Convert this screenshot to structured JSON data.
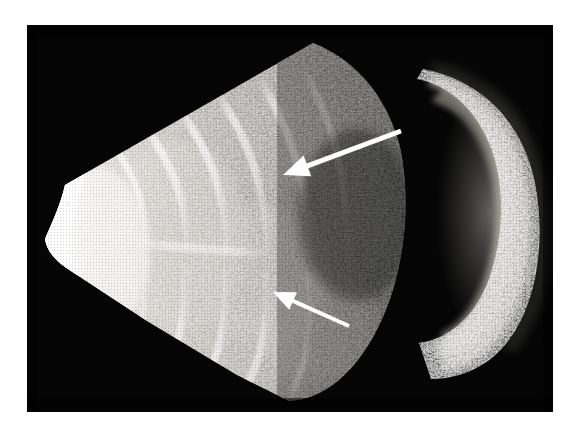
{
  "figure": {
    "kind": "medical-ultrasound-bscan",
    "modality": "B-mode ultrasonography",
    "caption": "",
    "page_background_color": "#ffffff",
    "frame": {
      "name": "scan-frame",
      "background_color": "#000000",
      "x": 27,
      "y": 25,
      "width": 526,
      "height": 387
    }
  },
  "scan": {
    "sector": {
      "label": "ultrasound sector fan",
      "description": "Sector-shaped acoustic field with apex at the left; bright near-field arc at the apex and radial striations fanning toward the right.",
      "apex_x": 45,
      "apex_y": 232,
      "near_field_color": "#f2f0ea",
      "mid_tissue_color": "#8d8a84",
      "far_field_color": "#262422"
    },
    "crescent": {
      "label": "posterior crescent structure",
      "description": "Curved band of echoes on the right side of the field, concave toward the transducer.",
      "center_x": 470,
      "center_y": 195,
      "brightness_color": "#b4b0a8"
    },
    "background_color": "#050505"
  },
  "annotations": {
    "arrow_color": "#ffffff",
    "items": [
      {
        "name": "annotation-arrow-upper",
        "label": "upper arrow",
        "tip_x": 283,
        "tip_y": 175,
        "tail_x": 401,
        "tail_y": 131,
        "head_length": 26,
        "head_width": 22,
        "shaft_width": 5
      },
      {
        "name": "annotation-arrow-lower",
        "label": "lower arrow",
        "tip_x": 273,
        "tip_y": 292,
        "tail_x": 349,
        "tail_y": 326,
        "head_length": 22,
        "head_width": 19,
        "shaft_width": 4
      }
    ]
  },
  "overlay_text": {
    "top_left": "",
    "top_right": "",
    "bottom_left": "",
    "bottom_right": ""
  }
}
